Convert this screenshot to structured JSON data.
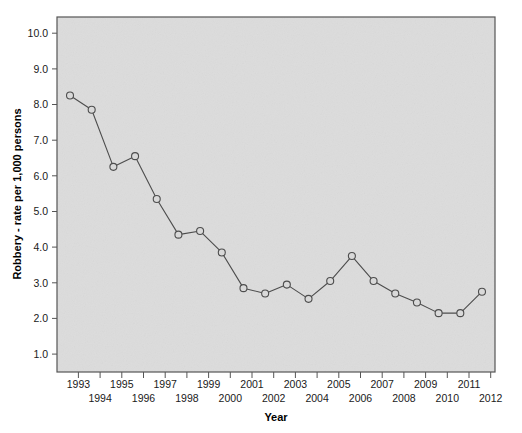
{
  "chart_data": {
    "type": "line",
    "title": "",
    "xlabel": "Year",
    "ylabel": "Robbery - rate per 1,000 persons",
    "x": [
      1993,
      1994,
      1995,
      1996,
      1997,
      1998,
      1999,
      2000,
      2001,
      2002,
      2003,
      2004,
      2005,
      2006,
      2007,
      2008,
      2009,
      2010,
      2011,
      2012
    ],
    "values": [
      8.3,
      7.9,
      6.3,
      6.6,
      5.4,
      4.4,
      4.5,
      3.9,
      2.9,
      2.75,
      3.0,
      2.6,
      3.1,
      3.8,
      3.1,
      2.75,
      2.5,
      2.2,
      2.2,
      2.8
    ],
    "categories": [
      "1993",
      "1994",
      "1995",
      "1996",
      "1997",
      "1998",
      "1999",
      "2000",
      "2001",
      "2002",
      "2003",
      "2004",
      "2005",
      "2006",
      "2007",
      "2008",
      "2009",
      "2010",
      "2011",
      "2012"
    ],
    "xtick_labels_top": [
      "1993",
      "1995",
      "1997",
      "1999",
      "2001",
      "2003",
      "2005",
      "2007",
      "2009",
      "2011"
    ],
    "xtick_labels_bottom": [
      "1994",
      "1996",
      "1998",
      "2000",
      "2002",
      "2004",
      "2006",
      "2008",
      "2010",
      "2012"
    ],
    "ytick_labels": [
      "10.0",
      "9.0",
      "8.0",
      "7.0",
      "6.0",
      "5.0",
      "4.0",
      "3.0",
      "2.0",
      "1.0"
    ],
    "ytick_values": [
      10.0,
      9.0,
      8.0,
      7.0,
      6.0,
      5.0,
      4.0,
      3.0,
      2.0,
      1.0
    ],
    "ylim": [
      0.55,
      10.5
    ],
    "xlim": [
      1992.4,
      2012.6
    ],
    "grid": false,
    "legend": null,
    "marker": "open-circle",
    "line_color": "#4d4d4d",
    "marker_edge_color": "#4d4d4d",
    "marker_face_color": "#d9d9d9",
    "plot_background_color": "#dcdcdc",
    "figure_background_color": "#ffffff",
    "axis_border_color": "#555555"
  },
  "axes": {
    "y_title": "Robbery - rate per 1,000 persons",
    "x_title": "Year"
  }
}
